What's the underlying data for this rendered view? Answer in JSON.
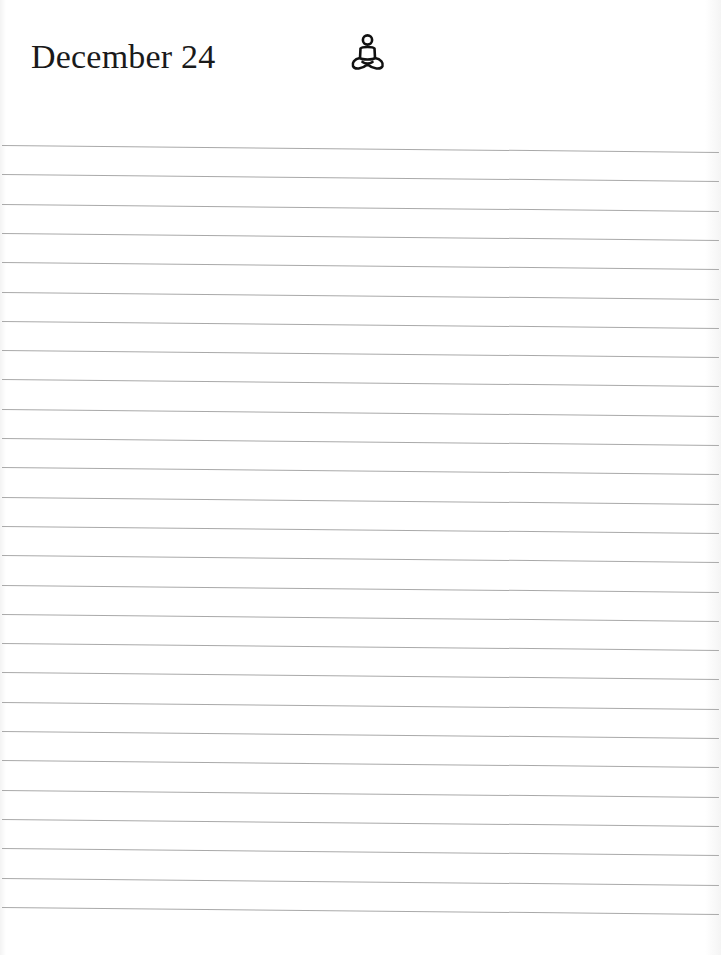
{
  "page": {
    "title": "December 24",
    "icon": "meditation-icon",
    "rule_count": 27,
    "rule_start_y": 145,
    "rule_spacing": 29.3,
    "rule_color": "#a9a9a9"
  }
}
